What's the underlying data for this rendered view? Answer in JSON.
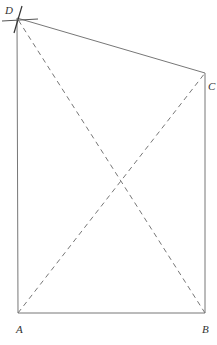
{
  "diagram": {
    "type": "quadrilateral-construction",
    "vertices": {
      "A": {
        "label": "A",
        "x": 18,
        "y": 313
      },
      "B": {
        "label": "B",
        "x": 205,
        "y": 313
      },
      "C": {
        "label": "C",
        "x": 205,
        "y": 73
      },
      "D": {
        "label": "D",
        "x": 17,
        "y": 18
      }
    },
    "sides": [
      "AB",
      "BC",
      "CD",
      "DA"
    ],
    "diagonals_dashed": [
      "AC",
      "BD"
    ],
    "construction_marks": [
      "arc-cross-at-D"
    ],
    "colors": {
      "line": "#666666",
      "label": "#333333"
    }
  }
}
